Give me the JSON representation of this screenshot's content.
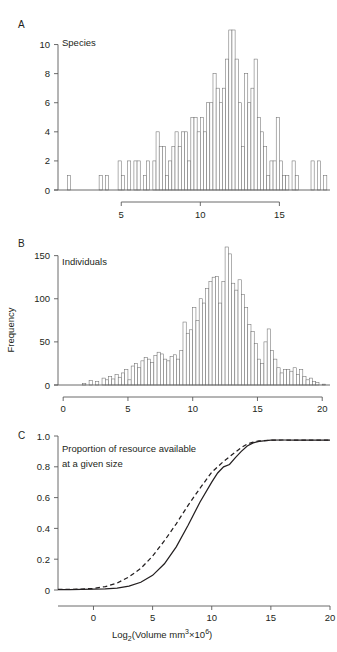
{
  "figure": {
    "panels": [
      {
        "letter": "A",
        "inner_label": "Species",
        "y_ticks": [
          "0",
          "2",
          "4",
          "6",
          "8",
          "10"
        ],
        "x_ticks": [
          "5",
          "10",
          "15"
        ]
      },
      {
        "letter": "B",
        "inner_label": "Individuals",
        "y_axis_title": "Frequency",
        "y_ticks": [
          "0",
          "50",
          "100",
          "150"
        ],
        "x_ticks": [
          "0",
          "5",
          "10",
          "15",
          "20"
        ]
      },
      {
        "letter": "C",
        "inner_label_line1": "Proportion of resource available",
        "inner_label_line2": "at a given size",
        "y_ticks": [
          "0",
          "0.2",
          "0.4",
          "0.6",
          "0.8",
          "1.0"
        ],
        "x_ticks": [
          "0",
          "5",
          "10",
          "15",
          "20"
        ],
        "x_axis_title_parts": {
          "prefix": "Log",
          "sub": "2",
          "mid": "(Volume mm",
          "sup1": "3",
          "times": "×",
          "base": "10",
          "sup2": "6",
          "suffix": ")"
        },
        "x_axis_title_plain": "Log2(Volume mm3×106)"
      }
    ],
    "colors": {
      "background": "#ffffff",
      "ink": "#231f20",
      "axis": "#5a5a5a",
      "bar_stroke": "#6e6e6e"
    }
  },
  "chart_data": [
    {
      "type": "bar",
      "panel": "A",
      "title": "Species",
      "xlabel": "Log2(Volume mm3x10^6)",
      "ylabel": "Frequency",
      "xlim": [
        1.0,
        18.2
      ],
      "ylim": [
        0,
        11
      ],
      "bin_width": 0.2,
      "x": [
        1.6,
        3.6,
        4.0,
        4.8,
        5.0,
        5.4,
        5.8,
        6.0,
        6.4,
        6.6,
        7.0,
        7.2,
        7.4,
        7.6,
        7.8,
        8.0,
        8.2,
        8.4,
        8.6,
        8.8,
        9.0,
        9.2,
        9.4,
        9.6,
        9.8,
        10.0,
        10.2,
        10.4,
        10.6,
        10.8,
        11.0,
        11.2,
        11.4,
        11.6,
        11.8,
        12.0,
        12.2,
        12.4,
        12.6,
        12.8,
        13.0,
        13.2,
        13.4,
        13.6,
        13.8,
        14.0,
        14.2,
        14.4,
        14.6,
        14.8,
        15.0,
        15.2,
        15.4,
        15.8,
        16.0,
        17.0,
        17.4,
        17.8
      ],
      "values": [
        1,
        1,
        1,
        2,
        1,
        2,
        2,
        2,
        1,
        2,
        2,
        4,
        3,
        3,
        1,
        2,
        3,
        4,
        3,
        4,
        4,
        2,
        5,
        5,
        4,
        5,
        4,
        6,
        6,
        8,
        7,
        6,
        7,
        9,
        11,
        11,
        9,
        6,
        3,
        8,
        6,
        7,
        9,
        5,
        4,
        3,
        1,
        2,
        2,
        5,
        2,
        1,
        1,
        2,
        1,
        2,
        2,
        1
      ]
    },
    {
      "type": "bar",
      "panel": "B",
      "title": "Individuals",
      "xlabel": "Log2(Volume mm3x10^6)",
      "ylabel": "Frequency",
      "xlim": [
        -0.4,
        20.6
      ],
      "ylim": [
        0,
        160
      ],
      "bin_width": 0.25,
      "x": [
        1.5,
        2.0,
        2.5,
        3.0,
        3.25,
        3.5,
        3.75,
        4.0,
        4.25,
        4.5,
        4.75,
        5.0,
        5.25,
        5.5,
        5.75,
        6.0,
        6.25,
        6.5,
        6.75,
        7.0,
        7.25,
        7.5,
        7.75,
        8.0,
        8.25,
        8.5,
        8.75,
        9.0,
        9.25,
        9.5,
        9.75,
        10.0,
        10.25,
        10.5,
        10.75,
        11.0,
        11.25,
        11.5,
        11.75,
        12.0,
        12.25,
        12.5,
        12.75,
        13.0,
        13.25,
        13.5,
        13.75,
        14.0,
        14.25,
        14.5,
        14.75,
        15.0,
        15.25,
        15.5,
        15.75,
        16.0,
        16.25,
        16.5,
        16.75,
        17.0,
        17.25,
        17.5,
        17.75,
        18.0,
        18.25,
        18.5,
        18.75,
        19.0,
        19.25,
        19.5,
        20.0
      ],
      "values": [
        2,
        5,
        4,
        8,
        6,
        10,
        7,
        12,
        9,
        14,
        18,
        6,
        22,
        25,
        20,
        28,
        32,
        30,
        26,
        34,
        38,
        36,
        30,
        28,
        33,
        35,
        30,
        40,
        73,
        60,
        64,
        90,
        75,
        100,
        95,
        112,
        120,
        125,
        126,
        95,
        120,
        160,
        152,
        118,
        110,
        122,
        105,
        90,
        70,
        62,
        48,
        30,
        25,
        50,
        65,
        40,
        30,
        20,
        14,
        18,
        18,
        16,
        20,
        12,
        18,
        10,
        6,
        8,
        4,
        3,
        1
      ]
    },
    {
      "type": "line",
      "panel": "C",
      "title": "Proportion of resource available at a given size",
      "xlabel": "Log2(Volume mm3x10^6)",
      "ylabel": "Proportion",
      "xlim": [
        -3,
        20
      ],
      "ylim": [
        0,
        1.0
      ],
      "legend": [],
      "series": [
        {
          "name": "solid",
          "style": "solid",
          "x": [
            -3,
            -2,
            -1,
            0,
            1,
            2,
            3,
            4,
            5,
            6,
            7,
            8,
            9,
            10,
            10.5,
            11,
            11.5,
            12,
            12.5,
            13,
            13.5,
            14,
            15,
            16,
            17,
            18,
            19,
            20
          ],
          "y": [
            0.003,
            0.003,
            0.004,
            0.005,
            0.007,
            0.012,
            0.025,
            0.05,
            0.095,
            0.17,
            0.28,
            0.42,
            0.57,
            0.7,
            0.76,
            0.8,
            0.815,
            0.86,
            0.9,
            0.935,
            0.955,
            0.965,
            0.973,
            0.974,
            0.974,
            0.974,
            0.974,
            0.974
          ]
        },
        {
          "name": "dashed",
          "style": "dashed",
          "x": [
            -3,
            -2,
            -1,
            0,
            1,
            2,
            3,
            4,
            5,
            6,
            7,
            8,
            9,
            10,
            10.5,
            11,
            11.5,
            12,
            12.5,
            13,
            13.5,
            14,
            15,
            16,
            17,
            18,
            19,
            20
          ],
          "y": [
            0.004,
            0.004,
            0.006,
            0.01,
            0.022,
            0.045,
            0.085,
            0.14,
            0.22,
            0.32,
            0.43,
            0.55,
            0.66,
            0.765,
            0.8,
            0.835,
            0.865,
            0.895,
            0.925,
            0.948,
            0.96,
            0.968,
            0.973,
            0.974,
            0.974,
            0.974,
            0.974,
            0.974
          ]
        }
      ]
    }
  ]
}
